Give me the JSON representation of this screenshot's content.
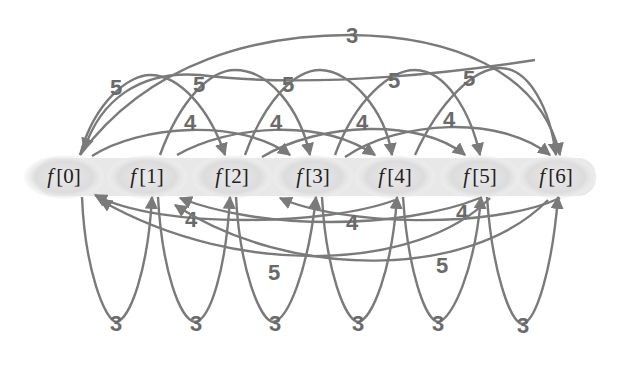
{
  "diagram": {
    "nodes": [
      {
        "id": "n0",
        "label_f": "f",
        "label_idx": "[0]",
        "x": 64
      },
      {
        "id": "n1",
        "label_f": "f",
        "label_idx": "[1]",
        "x": 147
      },
      {
        "id": "n2",
        "label_f": "f",
        "label_idx": "[2]",
        "x": 232
      },
      {
        "id": "n3",
        "label_f": "f",
        "label_idx": "[3]",
        "x": 313
      },
      {
        "id": "n4",
        "label_f": "f",
        "label_idx": "[4]",
        "x": 395
      },
      {
        "id": "n5",
        "label_f": "f",
        "label_idx": "[5]",
        "x": 480
      },
      {
        "id": "n6",
        "label_f": "f",
        "label_idx": "[6]",
        "x": 556
      }
    ],
    "edge_labels": {
      "top_long": "3",
      "top_skip2": [
        "5",
        "5",
        "5",
        "5",
        "5"
      ],
      "top_skip3": [
        "4",
        "4",
        "4",
        "4"
      ],
      "bottom_skip3": [
        "4",
        "4",
        "4"
      ],
      "bottom_long": [
        "5",
        "5"
      ],
      "bottom_loops": [
        "3",
        "3",
        "3",
        "3",
        "3",
        "3"
      ]
    },
    "colors": {
      "edge": "#7a7a7a",
      "label": "#6a6a6a",
      "node_fill": "#d9d9d9",
      "background": "#ffffff"
    }
  }
}
